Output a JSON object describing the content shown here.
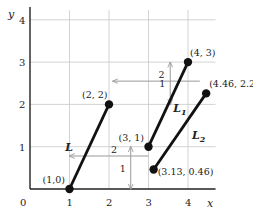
{
  "diagram": {
    "type": "coordinate-plane",
    "axes": {
      "x_label": "x",
      "y_label": "y",
      "x_ticks": [
        "0",
        "1",
        "2",
        "3",
        "4"
      ],
      "y_ticks": [
        "1",
        "2",
        "3",
        "4"
      ],
      "x_range": [
        0,
        4.9
      ],
      "y_range": [
        0,
        4.3
      ],
      "grid": true
    },
    "segments": [
      {
        "name": "L",
        "label": "L",
        "label_sub": "",
        "start": [
          1,
          0
        ],
        "end": [
          2,
          2
        ],
        "start_label": "(1,0)",
        "end_label": "(2, 2)"
      },
      {
        "name": "L1",
        "label": "L",
        "label_sub": "1",
        "start": [
          3,
          1
        ],
        "end": [
          4,
          3
        ],
        "start_label": "(3, 1)",
        "end_label": "(4, 3)"
      },
      {
        "name": "L2",
        "label": "L",
        "label_sub": "2",
        "start": [
          3.13,
          0.46
        ],
        "end": [
          4.46,
          2.26
        ],
        "start_label": "(3.13, 0.46)",
        "end_label": "(4.46, 2.26)"
      }
    ],
    "translations": [
      {
        "horizontal": {
          "from": 3,
          "to": 1,
          "at_y": 0.78,
          "label": "2"
        },
        "vertical": {
          "x": 2.55,
          "from": 0,
          "to": 1,
          "label": "1"
        }
      },
      {
        "horizontal": {
          "from": 4.3,
          "to": 2.1,
          "at_y": 2.55,
          "label": "2"
        },
        "vertical": {
          "x": 3.55,
          "from": 2,
          "to": 3,
          "label": "1"
        }
      }
    ],
    "colors": {
      "segment": "#111111",
      "grid": "#c8c8c8",
      "axis": "#222222",
      "arrow": "#999999"
    }
  }
}
